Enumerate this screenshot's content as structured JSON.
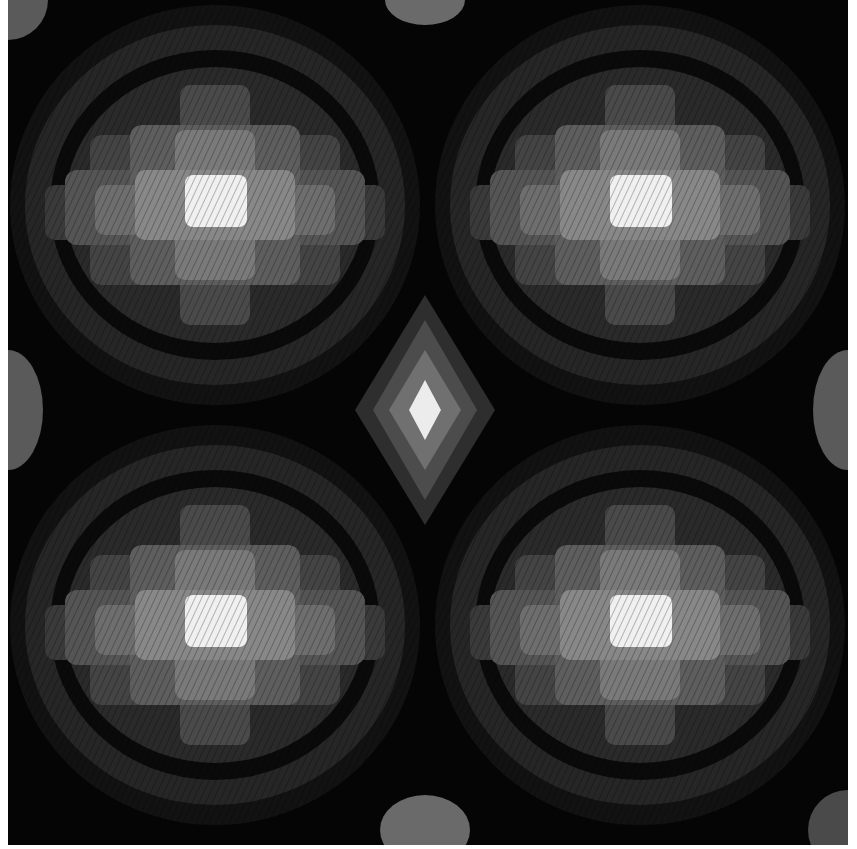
{
  "image": {
    "subject": "grayscale needlepoint / bargello embroidery pattern",
    "alt": "Four large concentric stepped-block medallions with bright centers on a black ground, with a small diamond motif in the middle",
    "palette": {
      "background": "#050505",
      "ring_dark": "#1e1e1e",
      "ring_mid_dark": "#333333",
      "ring_mid": "#555555",
      "ring_light": "#787878",
      "ring_lighter": "#9a9a9a",
      "center": "#f2f2f2"
    },
    "medallions": [
      {
        "cx": 215,
        "cy": 205
      },
      {
        "cx": 640,
        "cy": 205
      },
      {
        "cx": 215,
        "cy": 625
      },
      {
        "cx": 640,
        "cy": 625
      }
    ],
    "center_diamond": {
      "cx": 425,
      "cy": 410
    }
  }
}
